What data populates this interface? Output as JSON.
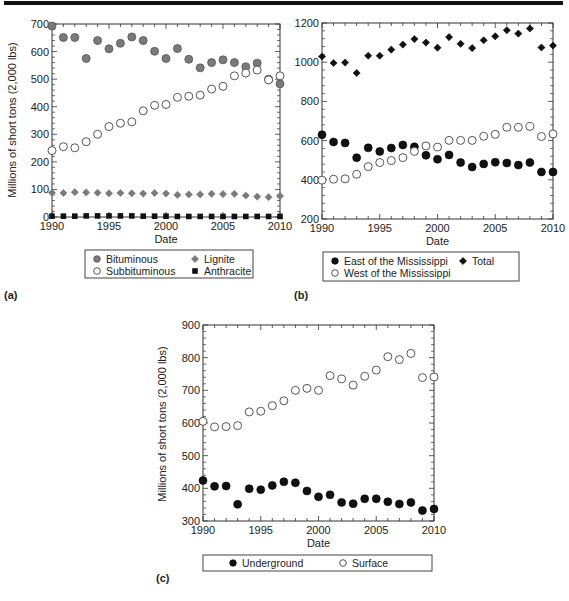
{
  "chart_data": [
    {
      "panel": "(a)",
      "type": "scatter",
      "title": "",
      "xlabel": "Date",
      "ylabel": "Millions of short tons (2,000 lbs)",
      "xlim": [
        1990,
        2010
      ],
      "ylim": [
        0,
        700
      ],
      "xticks": [
        1990,
        1995,
        2000,
        2005,
        2010
      ],
      "yticks": [
        0,
        100,
        200,
        300,
        400,
        500,
        600,
        700
      ],
      "grid": false,
      "legend_position": "below",
      "x": [
        1990,
        1991,
        1992,
        1993,
        1994,
        1995,
        1996,
        1997,
        1998,
        1999,
        2000,
        2001,
        2002,
        2003,
        2004,
        2005,
        2006,
        2007,
        2008,
        2009,
        2010
      ],
      "series": [
        {
          "name": "Bituminous",
          "marker": "circle-gray",
          "values": [
            693,
            651,
            651,
            575,
            640,
            610,
            630,
            653,
            640,
            601,
            575,
            611,
            572,
            541,
            560,
            570,
            560,
            545,
            558,
            500,
            483
          ]
        },
        {
          "name": "Subbituminous",
          "marker": "circle-open",
          "values": [
            241,
            255,
            251,
            273,
            300,
            328,
            340,
            345,
            385,
            405,
            408,
            434,
            438,
            442,
            464,
            474,
            512,
            522,
            533,
            497,
            512
          ]
        },
        {
          "name": "Lignite",
          "marker": "diamond-gray",
          "values": [
            88,
            87,
            90,
            89,
            88,
            86,
            87,
            86,
            85,
            87,
            85,
            80,
            82,
            82,
            84,
            83,
            84,
            78,
            74,
            72,
            76
          ]
        },
        {
          "name": "Anthracite",
          "marker": "square-black",
          "values": [
            3,
            3,
            3,
            4,
            4,
            4,
            4,
            4,
            3,
            3,
            3,
            2,
            2,
            2,
            2,
            2,
            2,
            2,
            2,
            2,
            2
          ]
        }
      ]
    },
    {
      "panel": "(b)",
      "type": "scatter",
      "title": "",
      "xlabel": "Date",
      "ylabel": "",
      "xlim": [
        1990,
        2010
      ],
      "ylim": [
        200,
        1200
      ],
      "xticks": [
        1990,
        1995,
        2000,
        2005,
        2010
      ],
      "yticks": [
        200,
        400,
        600,
        800,
        1000,
        1200
      ],
      "grid": false,
      "legend_position": "below",
      "x": [
        1990,
        1991,
        1992,
        1993,
        1994,
        1995,
        1996,
        1997,
        1998,
        1999,
        2000,
        2001,
        2002,
        2003,
        2004,
        2005,
        2006,
        2007,
        2008,
        2009,
        2010
      ],
      "series": [
        {
          "name": "East of the Mississippi",
          "marker": "circle-black",
          "values": [
            630,
            593,
            588,
            513,
            563,
            545,
            562,
            578,
            568,
            525,
            505,
            527,
            488,
            465,
            481,
            490,
            486,
            475,
            488,
            440,
            440
          ]
        },
        {
          "name": "West of the Mississippi",
          "marker": "circle-open",
          "values": [
            398,
            403,
            405,
            428,
            467,
            488,
            498,
            513,
            545,
            573,
            567,
            601,
            601,
            601,
            622,
            632,
            668,
            668,
            672,
            621,
            634
          ]
        },
        {
          "name": "Total",
          "marker": "diamond-black",
          "values": [
            1029,
            996,
            998,
            945,
            1033,
            1033,
            1064,
            1090,
            1118,
            1100,
            1074,
            1128,
            1094,
            1072,
            1112,
            1132,
            1163,
            1146,
            1172,
            1075,
            1085
          ]
        }
      ]
    },
    {
      "panel": "(c)",
      "type": "scatter",
      "title": "",
      "xlabel": "Date",
      "ylabel": "Millions of short tons (2,000 lbs)",
      "xlim": [
        1990,
        2010
      ],
      "ylim": [
        300,
        900
      ],
      "xticks": [
        1990,
        1995,
        2000,
        2005,
        2010
      ],
      "yticks": [
        300,
        400,
        500,
        600,
        700,
        800,
        900
      ],
      "grid": false,
      "legend_position": "below",
      "x": [
        1990,
        1991,
        1992,
        1993,
        1994,
        1995,
        1996,
        1997,
        1998,
        1999,
        2000,
        2001,
        2002,
        2003,
        2004,
        2005,
        2006,
        2007,
        2008,
        2009,
        2010
      ],
      "series": [
        {
          "name": "Underground",
          "marker": "circle-black",
          "values": [
            424,
            406,
            407,
            351,
            399,
            396,
            409,
            420,
            417,
            392,
            374,
            380,
            357,
            353,
            368,
            368,
            359,
            352,
            357,
            332,
            337
          ]
        },
        {
          "name": "Surface",
          "marker": "circle-open",
          "values": [
            605,
            588,
            589,
            592,
            634,
            636,
            653,
            668,
            700,
            706,
            700,
            745,
            735,
            716,
            743,
            762,
            803,
            794,
            813,
            739,
            741
          ]
        }
      ]
    }
  ],
  "colors": {
    "gray_marker": "#7a7a7a",
    "black_marker": "#111111",
    "axis": "#333333"
  }
}
